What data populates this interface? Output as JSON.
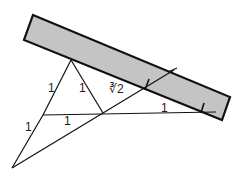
{
  "diagram": {
    "colors": {
      "ruler_fill": "#c4c4c4",
      "stroke": "#111111",
      "background": "#ffffff"
    },
    "ruler": {
      "corners": [
        [
          33,
          15
        ],
        [
          230,
          97
        ],
        [
          222,
          120
        ],
        [
          24,
          40
        ]
      ],
      "marks": [
        {
          "x1": 146,
          "y1": 89,
          "x2": 149,
          "y2": 79
        },
        {
          "x1": 201,
          "y1": 113,
          "x2": 204,
          "y2": 103
        }
      ]
    },
    "points": {
      "A_apex": [
        71,
        60
      ],
      "B_left": [
        43,
        115
      ],
      "C_mid": [
        103,
        113
      ],
      "D_bottom": [
        12,
        168
      ],
      "E_ruler_edge": [
        145,
        89
      ],
      "F_far": [
        216,
        112
      ]
    },
    "labels": [
      {
        "id": "label-AB",
        "text": "1",
        "x": 48,
        "y": 92
      },
      {
        "id": "label-AC",
        "text": "1",
        "x": 79,
        "y": 92
      },
      {
        "id": "label-CE",
        "text": "∛2",
        "x": 109,
        "y": 93
      },
      {
        "id": "label-EF",
        "text": "1",
        "x": 161,
        "y": 112
      },
      {
        "id": "label-BC",
        "text": "1",
        "x": 64,
        "y": 125
      },
      {
        "id": "label-BD",
        "text": "1",
        "x": 25,
        "y": 131
      }
    ]
  }
}
